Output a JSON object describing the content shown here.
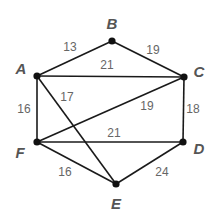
{
  "graph": {
    "nodes": [
      {
        "id": "A",
        "label": "A",
        "x": 37,
        "y": 76,
        "lx": 21,
        "ly": 74
      },
      {
        "id": "B",
        "label": "B",
        "x": 112,
        "y": 41,
        "lx": 112,
        "ly": 29
      },
      {
        "id": "C",
        "label": "C",
        "x": 184,
        "y": 77,
        "lx": 199,
        "ly": 77
      },
      {
        "id": "D",
        "label": "D",
        "x": 183,
        "y": 142,
        "lx": 199,
        "ly": 154
      },
      {
        "id": "F",
        "label": "F",
        "x": 37,
        "y": 142,
        "lx": 20,
        "ly": 158
      },
      {
        "id": "E",
        "label": "E",
        "x": 116,
        "y": 184,
        "lx": 116,
        "ly": 209
      }
    ],
    "edges": [
      {
        "from": "A",
        "to": "B",
        "weight": "13",
        "lx": 70,
        "ly": 51
      },
      {
        "from": "B",
        "to": "C",
        "weight": "19",
        "lx": 153,
        "ly": 54
      },
      {
        "from": "A",
        "to": "C",
        "weight": "21",
        "lx": 107,
        "ly": 69
      },
      {
        "from": "A",
        "to": "E",
        "weight": "17",
        "lx": 67,
        "ly": 101
      },
      {
        "from": "A",
        "to": "F",
        "weight": "16",
        "lx": 24,
        "ly": 113
      },
      {
        "from": "F",
        "to": "C",
        "weight": "19",
        "lx": 147,
        "ly": 110
      },
      {
        "from": "C",
        "to": "D",
        "weight": "18",
        "lx": 193,
        "ly": 113
      },
      {
        "from": "F",
        "to": "D",
        "weight": "21",
        "lx": 114,
        "ly": 137
      },
      {
        "from": "F",
        "to": "E",
        "weight": "16",
        "lx": 65,
        "ly": 176
      },
      {
        "from": "E",
        "to": "D",
        "weight": "24",
        "lx": 162,
        "ly": 176
      }
    ]
  }
}
